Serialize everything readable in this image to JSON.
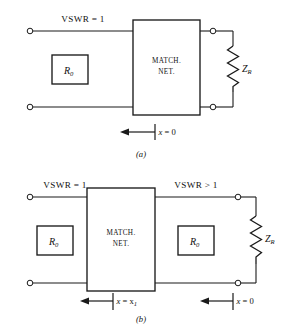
{
  "figure": {
    "ink_color": "#1a1a1a",
    "background_color": "#ffffff"
  },
  "panels": [
    {
      "id": "a",
      "caption": "(a)",
      "source_box_label": "R_0",
      "source_box_text": "R",
      "source_box_sub": "0",
      "network_label_line1": "MATCH.",
      "network_label_line2": "NET.",
      "left_vswr_label": "VSWR = 1",
      "right_vswr_label": "",
      "load_label_text": "Z",
      "load_label_sub": "R",
      "markers": [
        {
          "label_text": "x = 0",
          "var": "x",
          "rest": " = 0"
        }
      ]
    },
    {
      "id": "b",
      "caption": "(b)",
      "source_box_label": "R_0",
      "source_box_text": "R",
      "source_box_sub": "0",
      "network_label_line1": "MATCH.",
      "network_label_line2": "NET.",
      "left_vswr_label": "VSWR = 1",
      "right_vswr_label": "VSWR > 1",
      "second_box_text": "R",
      "second_box_sub": "0",
      "load_label_text": "Z",
      "load_label_sub": "R",
      "markers": [
        {
          "label_text": "x = x1",
          "var": "x",
          "rest": " = x",
          "rest_sub": "1"
        },
        {
          "label_text": "x = 0",
          "var": "x",
          "rest": " = 0"
        }
      ]
    }
  ],
  "labels": {
    "vswr_equal_one": "VSWR = 1",
    "vswr_greater_one": "VSWR > 1",
    "match": "MATCH.",
    "net": "NET.",
    "r_symbol": "R",
    "r_sub": "0",
    "z_symbol": "Z",
    "z_sub": "R",
    "x_symbol": "x",
    "eq_zero": " = 0",
    "eq_x": " = x",
    "x_one_sub": "1",
    "caption_a": "(a)",
    "caption_b": "(b)"
  }
}
